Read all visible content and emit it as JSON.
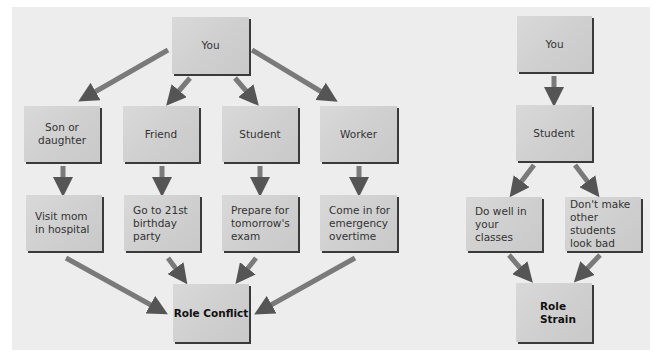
{
  "diagrams": {
    "role_conflict": {
      "root": "You",
      "roles": [
        "Son or daughter",
        "Friend",
        "Student",
        "Worker"
      ],
      "demands": [
        "Visit mom in hospital",
        "Go to 21st birthday party",
        "Prepare for tomorrow's exam",
        "Come in for emergency overtime"
      ],
      "result": "Role Conflict"
    },
    "role_strain": {
      "root": "You",
      "role": "Student",
      "demands": [
        "Do well in your classes",
        "Don't make other students look bad"
      ],
      "result": "Role Strain"
    }
  },
  "colors": {
    "panel": "#ededed",
    "box": "#d3d3d3",
    "box_shadow": "#3a3a3a",
    "arrow_dark": "#5a5a5a",
    "arrow_light": "#cfcfcf"
  }
}
